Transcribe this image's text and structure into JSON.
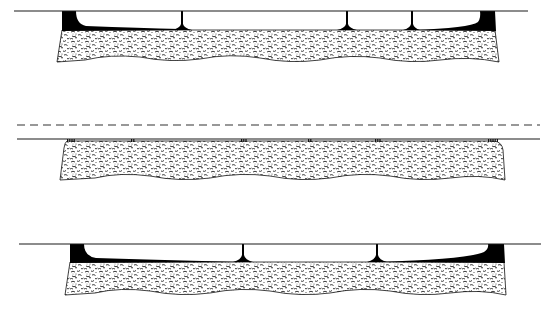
{
  "figure": {
    "width": 552,
    "height": 310,
    "colors": {
      "background": "#ffffff",
      "line": "#1a1a1a",
      "fill": "#000000",
      "texture": "#222222"
    },
    "panels": [
      {
        "id": "top",
        "description": "Surface with large fluid-filled gaps bridged by spokes; dark wedges at ends",
        "surface_line": {
          "x1": 14,
          "x2": 528,
          "y": 11
        },
        "body": {
          "left_top": 62,
          "left_bottom": 57,
          "right_top": 495,
          "right_bottom": 499,
          "top": 30,
          "bottom": 62
        },
        "end_wedges": [
          "left",
          "right"
        ],
        "spokes_x": [
          182,
          347,
          412
        ]
      },
      {
        "id": "middle",
        "description": "Surface in near contact with body via small asperity markers; dashed reference line above",
        "dashed_line": {
          "x1": 17,
          "x2": 540,
          "y": 125
        },
        "surface_line": {
          "x1": 17,
          "x2": 540,
          "y": 139
        },
        "body": {
          "left_top": 67,
          "left_bottom": 60,
          "right_top": 494,
          "right_bottom": 505,
          "top": 141,
          "bottom": 180
        },
        "asperity_groups": [
          {
            "x": 67,
            "count": 4
          },
          {
            "x": 131,
            "count": 2
          },
          {
            "x": 241,
            "count": 3
          },
          {
            "x": 308,
            "count": 2
          },
          {
            "x": 375,
            "count": 3
          },
          {
            "x": 488,
            "count": 5
          }
        ]
      },
      {
        "id": "bottom",
        "description": "Surface with large gaps bridged by spokes; dark wedges at ends",
        "surface_line": {
          "x1": 19,
          "x2": 541,
          "y": 244
        },
        "body": {
          "left_top": 70,
          "left_bottom": 65,
          "right_top": 504,
          "right_bottom": 506,
          "top": 262,
          "bottom": 295
        },
        "end_wedges": [
          "left",
          "right"
        ],
        "spokes_x": [
          243,
          377
        ]
      }
    ]
  }
}
